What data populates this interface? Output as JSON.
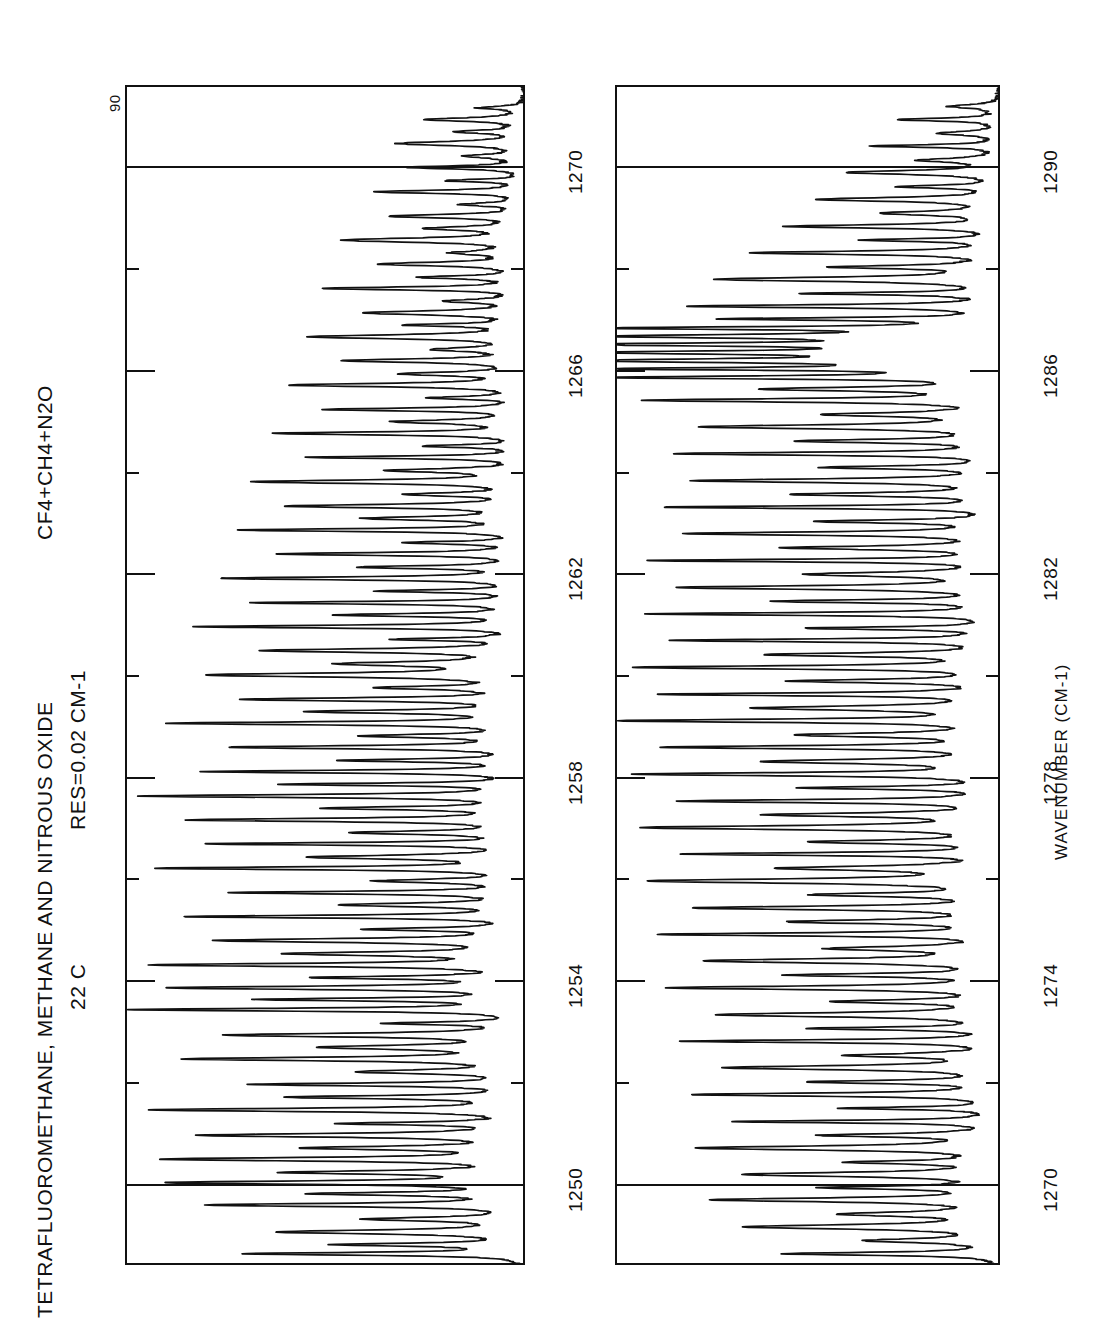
{
  "figure": {
    "title": "TETRAFLUOROMETHANE, METHANE AND NITROUS OXIDE",
    "resolution": "RES=0.02  CM-1",
    "temperature": "22 C",
    "mixture": "CF4+CH4+N2O",
    "y_top_label": "90",
    "axis_title": "WAVENUMBER  (CM-1)"
  },
  "panels": {
    "top": {
      "name": "top-spectrum-panel",
      "tick_labels": [
        "1250",
        "1254",
        "1258",
        "1262",
        "1266",
        "1270"
      ],
      "major_gridlines": [
        1250,
        1270
      ]
    },
    "bottom": {
      "name": "bottom-spectrum-panel",
      "tick_labels": [
        "1270",
        "1274",
        "1278",
        "1282",
        "1286",
        "1290"
      ],
      "major_gridlines": [
        1270,
        1290
      ]
    }
  },
  "chart_data": {
    "type": "line",
    "orientation": "rotated-90ccw",
    "title": "TETRAFLUOROMETHANE, METHANE AND NITROUS OXIDE",
    "subtitle": "CF4+CH4+N2O   RES=0.02 CM-1   22 C",
    "xlabel": "WAVENUMBER (CM-1)",
    "ylabel": "TRANSMITTANCE (%)",
    "ylim": [
      0,
      90
    ],
    "ytop": 90,
    "grid": true,
    "legend": null,
    "panels": [
      {
        "name": "top",
        "xlim": [
          1248.4,
          1271.6
        ],
        "xticks": [
          1250,
          1252,
          1254,
          1256,
          1258,
          1260,
          1262,
          1264,
          1266,
          1268,
          1270
        ],
        "xticklabels": [
          "1250",
          "",
          "1254",
          "",
          "1258",
          "",
          "1262",
          "",
          "1266",
          "",
          "1270"
        ],
        "peaks": [
          {
            "x": 1248.62,
            "depth": 62
          },
          {
            "x": 1248.8,
            "depth": 40
          },
          {
            "x": 1249.05,
            "depth": 55
          },
          {
            "x": 1249.3,
            "depth": 34
          },
          {
            "x": 1249.58,
            "depth": 70
          },
          {
            "x": 1249.8,
            "depth": 44
          },
          {
            "x": 1250.02,
            "depth": 78
          },
          {
            "x": 1250.22,
            "depth": 50
          },
          {
            "x": 1250.48,
            "depth": 80
          },
          {
            "x": 1250.7,
            "depth": 46
          },
          {
            "x": 1250.95,
            "depth": 72
          },
          {
            "x": 1251.18,
            "depth": 38
          },
          {
            "x": 1251.45,
            "depth": 84
          },
          {
            "x": 1251.7,
            "depth": 52
          },
          {
            "x": 1251.95,
            "depth": 60
          },
          {
            "x": 1252.2,
            "depth": 36
          },
          {
            "x": 1252.45,
            "depth": 74
          },
          {
            "x": 1252.68,
            "depth": 42
          },
          {
            "x": 1252.92,
            "depth": 66
          },
          {
            "x": 1253.15,
            "depth": 30
          },
          {
            "x": 1253.42,
            "depth": 88
          },
          {
            "x": 1253.62,
            "depth": 56
          },
          {
            "x": 1253.85,
            "depth": 78
          },
          {
            "x": 1254.05,
            "depth": 44
          },
          {
            "x": 1254.3,
            "depth": 82
          },
          {
            "x": 1254.52,
            "depth": 50
          },
          {
            "x": 1254.78,
            "depth": 68
          },
          {
            "x": 1255.0,
            "depth": 34
          },
          {
            "x": 1255.25,
            "depth": 76
          },
          {
            "x": 1255.48,
            "depth": 40
          },
          {
            "x": 1255.72,
            "depth": 64
          },
          {
            "x": 1255.95,
            "depth": 32
          },
          {
            "x": 1256.2,
            "depth": 80
          },
          {
            "x": 1256.42,
            "depth": 48
          },
          {
            "x": 1256.68,
            "depth": 70
          },
          {
            "x": 1256.9,
            "depth": 38
          },
          {
            "x": 1257.15,
            "depth": 74
          },
          {
            "x": 1257.38,
            "depth": 42
          },
          {
            "x": 1257.62,
            "depth": 86
          },
          {
            "x": 1257.85,
            "depth": 54
          },
          {
            "x": 1258.1,
            "depth": 72
          },
          {
            "x": 1258.32,
            "depth": 40
          },
          {
            "x": 1258.58,
            "depth": 66
          },
          {
            "x": 1258.8,
            "depth": 34
          },
          {
            "x": 1259.05,
            "depth": 78
          },
          {
            "x": 1259.28,
            "depth": 46
          },
          {
            "x": 1259.52,
            "depth": 62
          },
          {
            "x": 1259.75,
            "depth": 30
          },
          {
            "x": 1260.0,
            "depth": 70
          },
          {
            "x": 1260.22,
            "depth": 38
          },
          {
            "x": 1260.48,
            "depth": 58
          },
          {
            "x": 1260.7,
            "depth": 28
          },
          {
            "x": 1260.95,
            "depth": 74
          },
          {
            "x": 1261.18,
            "depth": 42
          },
          {
            "x": 1261.42,
            "depth": 60
          },
          {
            "x": 1261.65,
            "depth": 32
          },
          {
            "x": 1261.9,
            "depth": 68
          },
          {
            "x": 1262.12,
            "depth": 36
          },
          {
            "x": 1262.38,
            "depth": 56
          },
          {
            "x": 1262.6,
            "depth": 26
          },
          {
            "x": 1262.85,
            "depth": 64
          },
          {
            "x": 1263.08,
            "depth": 34
          },
          {
            "x": 1263.32,
            "depth": 52
          },
          {
            "x": 1263.55,
            "depth": 24
          },
          {
            "x": 1263.8,
            "depth": 60
          },
          {
            "x": 1264.02,
            "depth": 30
          },
          {
            "x": 1264.28,
            "depth": 48
          },
          {
            "x": 1264.5,
            "depth": 22
          },
          {
            "x": 1264.75,
            "depth": 56
          },
          {
            "x": 1264.98,
            "depth": 28
          },
          {
            "x": 1265.22,
            "depth": 44
          },
          {
            "x": 1265.45,
            "depth": 20
          },
          {
            "x": 1265.7,
            "depth": 52
          },
          {
            "x": 1265.92,
            "depth": 26
          },
          {
            "x": 1266.18,
            "depth": 40
          },
          {
            "x": 1266.4,
            "depth": 18
          },
          {
            "x": 1266.65,
            "depth": 48
          },
          {
            "x": 1266.88,
            "depth": 24
          },
          {
            "x": 1267.12,
            "depth": 36
          },
          {
            "x": 1267.35,
            "depth": 16
          },
          {
            "x": 1267.6,
            "depth": 44
          },
          {
            "x": 1267.82,
            "depth": 22
          },
          {
            "x": 1268.08,
            "depth": 32
          },
          {
            "x": 1268.3,
            "depth": 14
          },
          {
            "x": 1268.55,
            "depth": 40
          },
          {
            "x": 1268.78,
            "depth": 20
          },
          {
            "x": 1269.02,
            "depth": 30
          },
          {
            "x": 1269.25,
            "depth": 13
          },
          {
            "x": 1269.5,
            "depth": 34
          },
          {
            "x": 1269.72,
            "depth": 17
          },
          {
            "x": 1269.98,
            "depth": 26
          },
          {
            "x": 1270.2,
            "depth": 12
          },
          {
            "x": 1270.45,
            "depth": 28
          },
          {
            "x": 1270.68,
            "depth": 14
          },
          {
            "x": 1270.92,
            "depth": 22
          },
          {
            "x": 1271.15,
            "depth": 10
          }
        ]
      },
      {
        "name": "bottom",
        "xlim": [
          1268.4,
          1291.6
        ],
        "xticks": [
          1270,
          1272,
          1274,
          1276,
          1278,
          1280,
          1282,
          1284,
          1286,
          1288,
          1290
        ],
        "xticklabels": [
          "1270",
          "",
          "1274",
          "",
          "1278",
          "",
          "1282",
          "",
          "1286",
          "",
          "1290"
        ],
        "peaks": [
          {
            "x": 1268.62,
            "depth": 50
          },
          {
            "x": 1268.88,
            "depth": 30
          },
          {
            "x": 1269.15,
            "depth": 58
          },
          {
            "x": 1269.4,
            "depth": 34
          },
          {
            "x": 1269.68,
            "depth": 66
          },
          {
            "x": 1269.92,
            "depth": 38
          },
          {
            "x": 1270.18,
            "depth": 60
          },
          {
            "x": 1270.42,
            "depth": 32
          },
          {
            "x": 1270.7,
            "depth": 70
          },
          {
            "x": 1270.95,
            "depth": 40
          },
          {
            "x": 1271.22,
            "depth": 62
          },
          {
            "x": 1271.48,
            "depth": 36
          },
          {
            "x": 1271.75,
            "depth": 72
          },
          {
            "x": 1272.0,
            "depth": 42
          },
          {
            "x": 1272.28,
            "depth": 64
          },
          {
            "x": 1272.52,
            "depth": 34
          },
          {
            "x": 1272.8,
            "depth": 74
          },
          {
            "x": 1273.05,
            "depth": 44
          },
          {
            "x": 1273.32,
            "depth": 66
          },
          {
            "x": 1273.58,
            "depth": 36
          },
          {
            "x": 1273.85,
            "depth": 76
          },
          {
            "x": 1274.1,
            "depth": 46
          },
          {
            "x": 1274.38,
            "depth": 68
          },
          {
            "x": 1274.62,
            "depth": 38
          },
          {
            "x": 1274.9,
            "depth": 78
          },
          {
            "x": 1275.15,
            "depth": 48
          },
          {
            "x": 1275.42,
            "depth": 70
          },
          {
            "x": 1275.68,
            "depth": 40
          },
          {
            "x": 1275.95,
            "depth": 80
          },
          {
            "x": 1276.2,
            "depth": 50
          },
          {
            "x": 1276.48,
            "depth": 72
          },
          {
            "x": 1276.72,
            "depth": 42
          },
          {
            "x": 1277.0,
            "depth": 82
          },
          {
            "x": 1277.25,
            "depth": 52
          },
          {
            "x": 1277.52,
            "depth": 74
          },
          {
            "x": 1277.78,
            "depth": 44
          },
          {
            "x": 1278.05,
            "depth": 84
          },
          {
            "x": 1278.3,
            "depth": 54
          },
          {
            "x": 1278.58,
            "depth": 76
          },
          {
            "x": 1278.82,
            "depth": 46
          },
          {
            "x": 1279.1,
            "depth": 86
          },
          {
            "x": 1279.35,
            "depth": 56
          },
          {
            "x": 1279.62,
            "depth": 78
          },
          {
            "x": 1279.88,
            "depth": 48
          },
          {
            "x": 1280.15,
            "depth": 84
          },
          {
            "x": 1280.4,
            "depth": 54
          },
          {
            "x": 1280.68,
            "depth": 76
          },
          {
            "x": 1280.92,
            "depth": 46
          },
          {
            "x": 1281.2,
            "depth": 82
          },
          {
            "x": 1281.45,
            "depth": 52
          },
          {
            "x": 1281.72,
            "depth": 74
          },
          {
            "x": 1281.98,
            "depth": 44
          },
          {
            "x": 1282.25,
            "depth": 80
          },
          {
            "x": 1282.5,
            "depth": 50
          },
          {
            "x": 1282.78,
            "depth": 72
          },
          {
            "x": 1283.02,
            "depth": 42
          },
          {
            "x": 1283.3,
            "depth": 78
          },
          {
            "x": 1283.55,
            "depth": 48
          },
          {
            "x": 1283.82,
            "depth": 70
          },
          {
            "x": 1284.08,
            "depth": 40
          },
          {
            "x": 1284.35,
            "depth": 76
          },
          {
            "x": 1284.6,
            "depth": 46
          },
          {
            "x": 1284.88,
            "depth": 68
          },
          {
            "x": 1285.12,
            "depth": 38
          },
          {
            "x": 1285.4,
            "depth": 80
          },
          {
            "x": 1285.62,
            "depth": 52
          },
          {
            "x": 1285.85,
            "depth": 88
          },
          {
            "x": 1286.02,
            "depth": 84
          },
          {
            "x": 1286.18,
            "depth": 90
          },
          {
            "x": 1286.34,
            "depth": 86
          },
          {
            "x": 1286.5,
            "depth": 89
          },
          {
            "x": 1286.66,
            "depth": 85
          },
          {
            "x": 1286.82,
            "depth": 88
          },
          {
            "x": 1287.0,
            "depth": 62
          },
          {
            "x": 1287.25,
            "depth": 74
          },
          {
            "x": 1287.5,
            "depth": 44
          },
          {
            "x": 1287.78,
            "depth": 66
          },
          {
            "x": 1288.02,
            "depth": 36
          },
          {
            "x": 1288.3,
            "depth": 58
          },
          {
            "x": 1288.55,
            "depth": 30
          },
          {
            "x": 1288.82,
            "depth": 50
          },
          {
            "x": 1289.08,
            "depth": 26
          },
          {
            "x": 1289.35,
            "depth": 42
          },
          {
            "x": 1289.6,
            "depth": 22
          },
          {
            "x": 1289.88,
            "depth": 36
          },
          {
            "x": 1290.12,
            "depth": 18
          },
          {
            "x": 1290.4,
            "depth": 30
          },
          {
            "x": 1290.65,
            "depth": 15
          },
          {
            "x": 1290.92,
            "depth": 24
          },
          {
            "x": 1291.18,
            "depth": 12
          }
        ]
      }
    ]
  }
}
